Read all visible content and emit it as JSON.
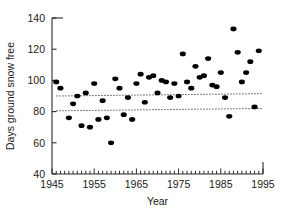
{
  "chart_data": {
    "type": "scatter",
    "title": "",
    "xlabel": "Year",
    "ylabel": "Days ground snow free",
    "xlim": [
      1945,
      1995
    ],
    "ylim": [
      40,
      140
    ],
    "xticks": [
      1945,
      1955,
      1965,
      1975,
      1985,
      1995
    ],
    "xtick_labels": [
      "1945",
      "1955",
      "1965",
      "1975",
      "1985",
      "1995"
    ],
    "yticks": [
      40,
      60,
      80,
      100,
      120,
      140
    ],
    "ytick_labels": [
      "40",
      "60",
      "80",
      "100",
      "120",
      "140"
    ],
    "x_minor_tick_interval": 1,
    "grid": false,
    "legend": null,
    "marker": {
      "shape": "circle",
      "color": "#000000",
      "size_px": 5.2
    },
    "points": [
      {
        "x": 1946,
        "y": 99
      },
      {
        "x": 1947,
        "y": 95
      },
      {
        "x": 1949,
        "y": 76
      },
      {
        "x": 1950,
        "y": 85
      },
      {
        "x": 1951,
        "y": 90
      },
      {
        "x": 1952,
        "y": 71
      },
      {
        "x": 1953,
        "y": 92
      },
      {
        "x": 1954,
        "y": 70
      },
      {
        "x": 1955,
        "y": 98
      },
      {
        "x": 1956,
        "y": 75
      },
      {
        "x": 1957,
        "y": 87
      },
      {
        "x": 1958,
        "y": 76
      },
      {
        "x": 1959,
        "y": 60
      },
      {
        "x": 1960,
        "y": 101
      },
      {
        "x": 1961,
        "y": 95
      },
      {
        "x": 1962,
        "y": 78
      },
      {
        "x": 1963,
        "y": 89
      },
      {
        "x": 1964,
        "y": 75
      },
      {
        "x": 1965,
        "y": 98
      },
      {
        "x": 1966,
        "y": 104
      },
      {
        "x": 1967,
        "y": 86
      },
      {
        "x": 1968,
        "y": 102
      },
      {
        "x": 1969,
        "y": 103
      },
      {
        "x": 1970,
        "y": 92
      },
      {
        "x": 1971,
        "y": 100
      },
      {
        "x": 1972,
        "y": 99
      },
      {
        "x": 1973,
        "y": 89
      },
      {
        "x": 1974,
        "y": 98
      },
      {
        "x": 1975,
        "y": 90
      },
      {
        "x": 1976,
        "y": 117
      },
      {
        "x": 1977,
        "y": 99
      },
      {
        "x": 1978,
        "y": 95
      },
      {
        "x": 1979,
        "y": 109
      },
      {
        "x": 1980,
        "y": 102
      },
      {
        "x": 1981,
        "y": 103
      },
      {
        "x": 1982,
        "y": 114
      },
      {
        "x": 1983,
        "y": 97
      },
      {
        "x": 1984,
        "y": 96
      },
      {
        "x": 1985,
        "y": 105
      },
      {
        "x": 1986,
        "y": 89
      },
      {
        "x": 1987,
        "y": 77
      },
      {
        "x": 1988,
        "y": 133
      },
      {
        "x": 1989,
        "y": 118
      },
      {
        "x": 1990,
        "y": 99
      },
      {
        "x": 1991,
        "y": 105
      },
      {
        "x": 1992,
        "y": 112
      },
      {
        "x": 1993,
        "y": 83
      },
      {
        "x": 1994,
        "y": 119
      }
    ],
    "reference_lines": [
      {
        "name": "upper-dotted-line",
        "style": "dotted",
        "x0": 1946,
        "y0": 90,
        "x1": 1995,
        "y1": 91.5
      },
      {
        "name": "lower-dotted-line",
        "style": "dotted",
        "x0": 1946,
        "y0": 80.5,
        "x1": 1995,
        "y1": 82
      }
    ]
  }
}
